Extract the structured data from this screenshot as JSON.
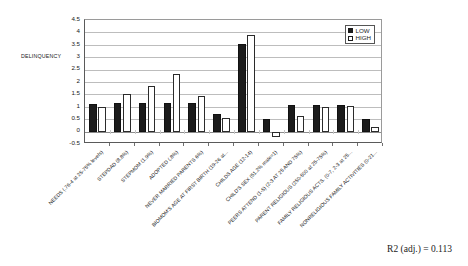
{
  "chart_data": {
    "type": "bar",
    "title": "",
    "xlabel": "",
    "ylabel": "DELINQUENCY",
    "ylim": [
      -0.5,
      4.5
    ],
    "ytick_step": 0.5,
    "yticks": [
      "4.5",
      "4",
      "3.5",
      "3",
      "2.5",
      "2",
      "1.5",
      "1",
      "0.5",
      "0",
      "-0.5"
    ],
    "grid": true,
    "legend_position": "top-right-inside",
    "categories": [
      "NEEDS (.76-4 at 25-75% levels)",
      "STEPDAD (8.8%)",
      "STEPMOM (1.9%)",
      "ADOPTED (.8%)",
      "NEVER MARRIED PARENTS 6%)",
      "BIOMOM'S AGE AT FIRST BIRTH (19-26 at...",
      "CHILDS AGE (12-14)",
      "CHILD'S SEX (51.2% male=1)",
      "PEERS ATTEND (1-5) (2-3 AT 25 AND 75%)",
      "PARENT RELIGIOUS (250-500 at 25-75%)",
      "FAMILY RELIGIOUS ACTS. (0-7, 2-3 at  25...",
      "NONRELIGIOUS FAMILY ACTIVITIES (0-21..."
    ],
    "series": [
      {
        "name": "LOW",
        "color": "#1c1c1c",
        "values": [
          1.12,
          1.15,
          1.16,
          1.16,
          1.16,
          0.72,
          3.52,
          0.5,
          1.06,
          1.07,
          1.07,
          0.51
        ]
      },
      {
        "name": "HIGH",
        "color": "#ffffff",
        "values": [
          1.01,
          1.5,
          1.83,
          2.33,
          1.45,
          0.56,
          3.9,
          -0.2,
          0.62,
          0.99,
          1.02,
          0.19
        ]
      }
    ],
    "annotations": [
      {
        "name": "r2-adjusted",
        "text": "R2 (adj.) = 0.113"
      }
    ]
  },
  "legend": {
    "items": [
      {
        "label": "LOW",
        "swatch": "filled-black-square"
      },
      {
        "label": "HIGH",
        "swatch": "open-white-square"
      }
    ]
  }
}
